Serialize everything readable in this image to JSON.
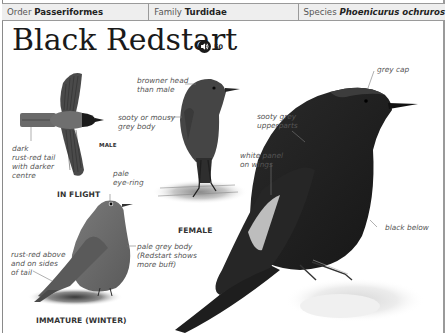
{
  "taxonomy": {
    "order_label": "Order",
    "order_value": "Passeriformes",
    "family_label": "Family",
    "family_value": "Turdidae",
    "species_label": "Species",
    "species_value": "Phoenicurus ochruros"
  },
  "title": "Black Redstart",
  "audio": {
    "icon": "speaker-icon",
    "track_number": "50"
  },
  "figures": {
    "in_flight": {
      "caption": "IN FLIGHT",
      "sex_label": "MALE",
      "annotations": [
        "dark\nrust-red tail\nwith darker\ncentre"
      ]
    },
    "female": {
      "caption": "FEMALE",
      "annotations": [
        "browner head\nthan male",
        "sooty or mousy\ngrey body"
      ]
    },
    "immature": {
      "caption": "IMMATURE (WINTER)",
      "annotations": [
        "pale\neye-ring",
        "pale grey body\n(Redstart shows\nmore buff)",
        "rust-red above\nand on sides\nof tail"
      ]
    },
    "male_perched": {
      "annotations": [
        "grey cap",
        "sooty grey\nupperparts",
        "white panel\non wings",
        "black below"
      ]
    }
  },
  "colors": {
    "header_bg": "#eeeeee",
    "rule": "#9a9a9a",
    "title_text": "#1a1a1a",
    "annotation_text": "#555555"
  }
}
